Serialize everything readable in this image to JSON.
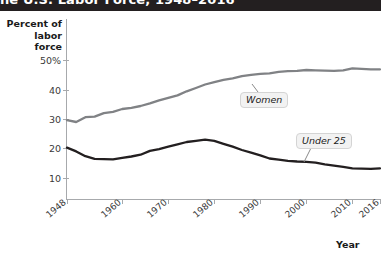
{
  "title": "he U.S. Labor Force, 1948–2016",
  "colors": {
    "titlebar": "#231f20",
    "women_line": "#808285",
    "under25_line": "#231f20",
    "axis": "#a7a9ac",
    "callout_bg": "#f2f2f2"
  },
  "axes": {
    "ylabel": "Percent of\nlabor force",
    "xlabel": "Year",
    "yticks": [
      "50%",
      "40",
      "30",
      "20",
      "10"
    ],
    "xticks": [
      "1948",
      "1960",
      "1970",
      "1980",
      "1990",
      "2000",
      "2010",
      "2016"
    ]
  },
  "callouts": {
    "women": "Women",
    "under25": "Under 25"
  },
  "chart_data": {
    "type": "line",
    "title": "he U.S. Labor Force, 1948–2016",
    "xlabel": "Year",
    "ylabel": "Percent of labor force",
    "xlim": [
      1948,
      2016
    ],
    "ylim": [
      0,
      55
    ],
    "yticks": [
      10,
      20,
      30,
      40,
      50
    ],
    "xticks": [
      1948,
      1960,
      1970,
      1980,
      1990,
      2000,
      2010,
      2016
    ],
    "grid": false,
    "legend": "inline-callouts",
    "series": [
      {
        "name": "Women",
        "color": "#808285",
        "x": [
          1948,
          1950,
          1952,
          1954,
          1956,
          1958,
          1960,
          1962,
          1964,
          1966,
          1968,
          1970,
          1972,
          1974,
          1976,
          1978,
          1980,
          1982,
          1984,
          1986,
          1988,
          1990,
          1992,
          1994,
          1996,
          1998,
          2000,
          2002,
          2004,
          2006,
          2008,
          2010,
          2012,
          2014,
          2016
        ],
        "values": [
          29.6,
          29.0,
          30.6,
          30.8,
          32.0,
          32.4,
          33.4,
          33.8,
          34.4,
          35.3,
          36.3,
          37.2,
          38.0,
          39.4,
          40.5,
          41.7,
          42.5,
          43.3,
          43.8,
          44.5,
          45.0,
          45.3,
          45.5,
          46.0,
          46.2,
          46.3,
          46.6,
          46.5,
          46.4,
          46.3,
          46.5,
          47.2,
          47.0,
          46.8,
          46.8
        ]
      },
      {
        "name": "Under 25",
        "color": "#231f20",
        "x": [
          1948,
          1950,
          1952,
          1954,
          1956,
          1958,
          1960,
          1962,
          1964,
          1966,
          1968,
          1970,
          1972,
          1974,
          1976,
          1978,
          1980,
          1982,
          1984,
          1986,
          1988,
          1990,
          1992,
          1994,
          1996,
          1998,
          2000,
          2002,
          2004,
          2006,
          2008,
          2010,
          2012,
          2014,
          2016
        ],
        "values": [
          20.3,
          19.0,
          17.4,
          16.5,
          16.4,
          16.3,
          16.8,
          17.3,
          17.9,
          19.2,
          19.8,
          20.6,
          21.4,
          22.2,
          22.6,
          23.0,
          22.6,
          21.6,
          20.6,
          19.5,
          18.6,
          17.7,
          16.6,
          16.2,
          15.8,
          15.6,
          15.5,
          15.2,
          14.6,
          14.2,
          13.8,
          13.3,
          13.2,
          13.1,
          13.3
        ]
      }
    ]
  }
}
